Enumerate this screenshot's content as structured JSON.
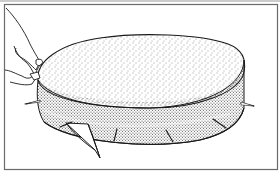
{
  "figure": {
    "colors": {
      "background": "#ffffff",
      "line": "#1a1a1a",
      "frame": "#6a6a6a",
      "stipple": "#333333"
    },
    "elements": {
      "frame": "border-frame",
      "cake_top": "cake-top-surface",
      "cake_side": "cake-side-band",
      "hand": "hand",
      "knife": "knife",
      "toothpicks": [
        {
          "name": "toothpick-left",
          "x1": 26,
          "y1": 104,
          "x2": 39,
          "y2": 102
        },
        {
          "name": "toothpick-front-left",
          "x1": 61,
          "y1": 127,
          "x2": 72,
          "y2": 122
        },
        {
          "name": "toothpick-front-mid",
          "x1": 117,
          "y1": 130,
          "x2": 114,
          "y2": 141
        },
        {
          "name": "toothpick-front-right",
          "x1": 167,
          "y1": 130,
          "x2": 173,
          "y2": 142
        },
        {
          "name": "toothpick-right-front",
          "x1": 213,
          "y1": 120,
          "x2": 226,
          "y2": 128
        },
        {
          "name": "toothpick-right",
          "x1": 240,
          "y1": 103,
          "x2": 253,
          "y2": 106
        }
      ]
    }
  }
}
